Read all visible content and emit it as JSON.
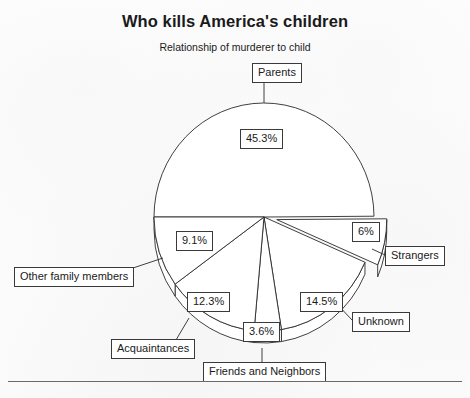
{
  "chart": {
    "title": "Who kills America's children",
    "subtitle": "Relationship of murderer to child"
  },
  "chart_data": {
    "type": "pie",
    "title": "Who kills America's children",
    "subtitle": "Relationship of murderer to child",
    "xlabel": "",
    "ylabel": "",
    "units": "percent",
    "exploded_slices": [
      "Strangers"
    ],
    "style": "3d-outline",
    "legend": "callout-labels",
    "categories": [
      "Parents",
      "Strangers",
      "Unknown",
      "Friends and Neighbors",
      "Acquaintances",
      "Other family members"
    ],
    "values": [
      45.3,
      6,
      14.5,
      3.6,
      12.3,
      9.1
    ],
    "labels": [
      "45.3%",
      "6%",
      "14.5%",
      "3.6%",
      "12.3%",
      "9.1%"
    ],
    "slices": [
      {
        "name": "Parents",
        "value": 45.3,
        "label": "45.3%",
        "exploded": false
      },
      {
        "name": "Strangers",
        "value": 6,
        "label": "6%",
        "exploded": true
      },
      {
        "name": "Unknown",
        "value": 14.5,
        "label": "14.5%",
        "exploded": false
      },
      {
        "name": "Friends and Neighbors",
        "value": 3.6,
        "label": "3.6%",
        "exploded": false
      },
      {
        "name": "Acquaintances",
        "value": 12.3,
        "label": "12.3%",
        "exploded": false
      },
      {
        "name": "Other family members",
        "value": 9.1,
        "label": "9.1%",
        "exploded": false
      }
    ]
  },
  "callouts": {
    "parents": "Parents",
    "strangers": "Strangers",
    "unknown": "Unknown",
    "friends_and_neighbors": "Friends and Neighbors",
    "acquaintances": "Acquaintances",
    "other_family_members": "Other family members"
  },
  "percent_labels": {
    "parents": "45.3%",
    "strangers": "6%",
    "unknown": "14.5%",
    "friends_and_neighbors": "3.6%",
    "acquaintances": "12.3%",
    "other_family_members": "9.1%"
  },
  "colors": {
    "ink": "#2a2a2a",
    "slice_fill": "#ffffff",
    "background": "#fdfdfd"
  }
}
